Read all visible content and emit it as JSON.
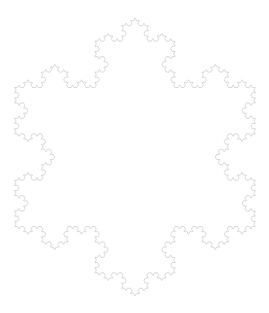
{
  "figure": {
    "type": "koch-snowflake",
    "iterations": 4,
    "center": [
      135,
      157
    ],
    "circumradius": 139,
    "orientation": "vertex-up",
    "background_color": "#ffffff",
    "stroke_color": "#c8c8c8",
    "stroke_width": 0.7
  }
}
